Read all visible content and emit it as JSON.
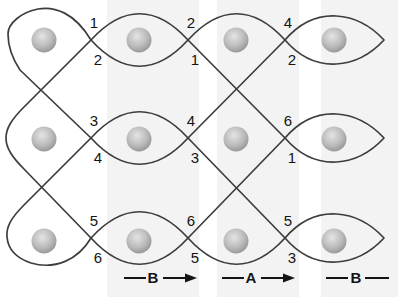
{
  "colors": {
    "line": "#3d3d3d",
    "number": "#141414",
    "node_fill": "#bcbcbc",
    "band": "#f3f3f3"
  },
  "crossings": [
    {
      "row": 1,
      "position": "left",
      "above": "1",
      "below": "2"
    },
    {
      "row": 1,
      "position": "middle",
      "above": "2",
      "below": "1"
    },
    {
      "row": 1,
      "position": "right",
      "above": "4",
      "below": "2"
    },
    {
      "row": 2,
      "position": "left",
      "above": "3",
      "below": "4"
    },
    {
      "row": 2,
      "position": "middle",
      "above": "4",
      "below": "3"
    },
    {
      "row": 2,
      "position": "right",
      "above": "6",
      "below": "1"
    },
    {
      "row": 3,
      "position": "left",
      "above": "5",
      "below": "6"
    },
    {
      "row": 3,
      "position": "middle",
      "above": "6",
      "below": "5"
    },
    {
      "row": 3,
      "position": "right",
      "above": "5",
      "below": "3"
    }
  ],
  "bottom_labels": [
    {
      "label": "B",
      "style": "arrow"
    },
    {
      "label": "A",
      "style": "arrow"
    },
    {
      "label": "B",
      "style": "dash"
    }
  ]
}
